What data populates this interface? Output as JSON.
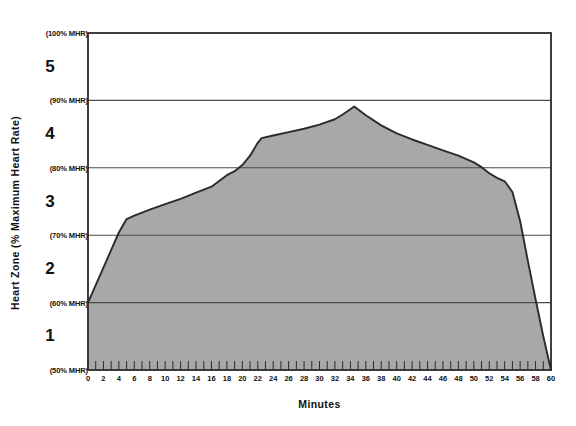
{
  "chart_data": {
    "type": "area",
    "title": "",
    "xlabel": "Minutes",
    "ylabel": "Heart Zone (% Maximum Heart Rate)",
    "xlim": [
      0,
      60
    ],
    "ylim": [
      50,
      100
    ],
    "grid": true,
    "legend_position": "none",
    "x_tick_step_minor": 1,
    "x_tick_step_major": 2,
    "x_tick_labels": [
      "0",
      "2",
      "4",
      "6",
      "8",
      "10",
      "12",
      "14",
      "16",
      "18",
      "20",
      "22",
      "24",
      "26",
      "28",
      "30",
      "32",
      "34",
      "36",
      "38",
      "40",
      "42",
      "44",
      "46",
      "48",
      "50",
      "52",
      "54",
      "56",
      "58",
      "60"
    ],
    "y_gridlines": [
      {
        "value": 50,
        "label": "(50% MHR)"
      },
      {
        "value": 60,
        "label": "(60% MHR)"
      },
      {
        "value": 70,
        "label": "(70% MHR)"
      },
      {
        "value": 80,
        "label": "(80% MHR)"
      },
      {
        "value": 90,
        "label": "(90% MHR)"
      },
      {
        "value": 100,
        "label": "(100% MHR)"
      }
    ],
    "zones": [
      {
        "label": "1",
        "range": [
          50,
          60
        ],
        "center": 55
      },
      {
        "label": "2",
        "range": [
          60,
          70
        ],
        "center": 65
      },
      {
        "label": "3",
        "range": [
          70,
          80
        ],
        "center": 75
      },
      {
        "label": "4",
        "range": [
          80,
          90
        ],
        "center": 85
      },
      {
        "label": "5",
        "range": [
          90,
          100
        ],
        "center": 95
      }
    ],
    "series": [
      {
        "name": "Heart rate profile",
        "fill_color": "#a8a8a8",
        "line_color": "#2b2b2b",
        "x": [
          0,
          2,
          4,
          5,
          6,
          8,
          10,
          12,
          14,
          16,
          18,
          19,
          20,
          21,
          22,
          22.5,
          24,
          26,
          28,
          30,
          31,
          32,
          33,
          34,
          34.5,
          36,
          38,
          40,
          42,
          44,
          46,
          48,
          50,
          51,
          52,
          53,
          54,
          55,
          56,
          57,
          58,
          59,
          60
        ],
        "y": [
          60.0,
          65.2,
          70.4,
          72.4,
          72.9,
          73.8,
          74.6,
          75.4,
          76.3,
          77.2,
          78.9,
          79.5,
          80.4,
          81.8,
          83.7,
          84.4,
          84.8,
          85.3,
          85.8,
          86.4,
          86.8,
          87.2,
          87.9,
          88.7,
          89.1,
          87.8,
          86.3,
          85.1,
          84.2,
          83.4,
          82.6,
          81.8,
          80.8,
          80.1,
          79.2,
          78.5,
          78.0,
          76.4,
          72.1,
          66.2,
          60.5,
          55.0,
          50.0
        ]
      }
    ]
  },
  "axis": {
    "y_title": "Heart Zone (% Maximum Heart Rate)",
    "x_title": "Minutes"
  },
  "colors": {
    "fill": "#a8a8a8",
    "line": "#2b2b2b",
    "frame": "#2b2b2b",
    "grid": "#4a4a4a",
    "background": "#ffffff"
  }
}
